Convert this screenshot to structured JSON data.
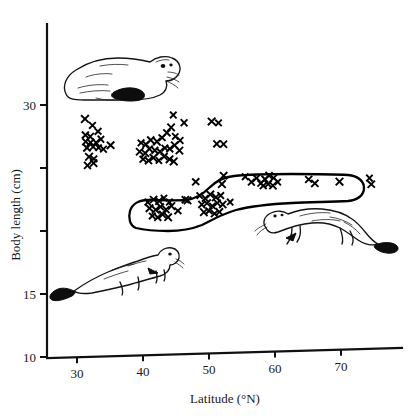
{
  "figure": {
    "title": "",
    "background_color": "#ffffff",
    "ink_color": "#111111"
  },
  "axes": {
    "y_title": "Body length (cm)",
    "x_title": "Latitude (°N)",
    "x_ticks": [
      {
        "value": 30,
        "label": "30"
      },
      {
        "value": 40,
        "label": "40"
      },
      {
        "value": 50,
        "label": "50"
      },
      {
        "value": 60,
        "label": "60"
      },
      {
        "value": 70,
        "label": "70"
      }
    ],
    "y_ticks": [
      {
        "value": 30,
        "label": "30"
      },
      {
        "value": 25,
        "label": ""
      },
      {
        "value": 20,
        "label": ""
      },
      {
        "value": 15,
        "label": "15"
      },
      {
        "value": 10,
        "label": "10"
      }
    ]
  },
  "chart_data": {
    "type": "scatter",
    "title": "",
    "xlabel": "Latitude (°N)",
    "ylabel": "Body length (cm)",
    "xlim": [
      27,
      77
    ],
    "ylim": [
      10,
      34
    ],
    "grid": false,
    "legend": "none",
    "marker": "x",
    "annotations": [
      {
        "name": "enclosed-outline",
        "type": "hull",
        "describes": "hand-drawn outline enclosing the lower (stoat) point cluster"
      },
      {
        "name": "weasel-resting-illustration",
        "type": "drawing"
      },
      {
        "name": "weasel-running-illustration",
        "type": "drawing"
      },
      {
        "name": "stoat-illustration",
        "type": "drawing"
      }
    ],
    "series": [
      {
        "name": "upper cluster (larger-bodied mustelid)",
        "enclosed": false,
        "points": [
          [
            31.2,
            28.9
          ],
          [
            32.3,
            28.4
          ],
          [
            31.3,
            27.6
          ],
          [
            32.0,
            27.5
          ],
          [
            33.2,
            27.9
          ],
          [
            31.3,
            27.1
          ],
          [
            32.1,
            27.0
          ],
          [
            32.9,
            27.0
          ],
          [
            33.6,
            27.3
          ],
          [
            31.5,
            26.6
          ],
          [
            32.4,
            26.7
          ],
          [
            33.3,
            26.6
          ],
          [
            34.0,
            26.5
          ],
          [
            35.1,
            26.8
          ],
          [
            31.8,
            25.9
          ],
          [
            32.6,
            25.7
          ],
          [
            31.6,
            25.2
          ],
          [
            32.5,
            25.4
          ],
          [
            39.7,
            27.0
          ],
          [
            40.4,
            26.9
          ],
          [
            41.2,
            27.2
          ],
          [
            42.1,
            27.1
          ],
          [
            42.9,
            27.4
          ],
          [
            43.6,
            27.8
          ],
          [
            44.3,
            28.2
          ],
          [
            44.9,
            27.5
          ],
          [
            45.6,
            27.2
          ],
          [
            39.5,
            26.3
          ],
          [
            40.3,
            26.2
          ],
          [
            41.0,
            26.5
          ],
          [
            41.8,
            26.4
          ],
          [
            42.6,
            26.3
          ],
          [
            43.3,
            26.6
          ],
          [
            44.1,
            26.5
          ],
          [
            44.8,
            26.8
          ],
          [
            45.5,
            26.4
          ],
          [
            40.0,
            25.7
          ],
          [
            40.8,
            25.6
          ],
          [
            41.6,
            25.8
          ],
          [
            42.4,
            25.6
          ],
          [
            43.2,
            25.9
          ],
          [
            44.0,
            25.7
          ],
          [
            44.7,
            25.5
          ],
          [
            44.6,
            29.2
          ],
          [
            46.2,
            28.6
          ],
          [
            50.4,
            28.7
          ],
          [
            51.4,
            28.6
          ],
          [
            51.2,
            26.9
          ],
          [
            52.2,
            26.9
          ]
        ]
      },
      {
        "name": "lower cluster (smaller-bodied mustelid, enclosed)",
        "enclosed": true,
        "points": [
          [
            40.7,
            22.3
          ],
          [
            41.6,
            22.5
          ],
          [
            42.4,
            22.4
          ],
          [
            43.2,
            22.6
          ],
          [
            44.0,
            22.3
          ],
          [
            41.0,
            21.8
          ],
          [
            41.9,
            21.7
          ],
          [
            42.7,
            21.9
          ],
          [
            43.5,
            21.7
          ],
          [
            44.3,
            22.0
          ],
          [
            41.4,
            21.2
          ],
          [
            42.2,
            21.1
          ],
          [
            43.0,
            21.3
          ],
          [
            43.8,
            21.1
          ],
          [
            45.3,
            21.6
          ],
          [
            46.4,
            22.5
          ],
          [
            46.8,
            22.4
          ],
          [
            48.6,
            22.8
          ],
          [
            49.4,
            22.6
          ],
          [
            50.2,
            22.9
          ],
          [
            51.0,
            22.7
          ],
          [
            51.8,
            22.8
          ],
          [
            48.9,
            22.1
          ],
          [
            49.7,
            22.2
          ],
          [
            50.5,
            22.0
          ],
          [
            51.3,
            22.2
          ],
          [
            52.1,
            22.1
          ],
          [
            49.2,
            21.5
          ],
          [
            50.0,
            21.6
          ],
          [
            50.8,
            21.4
          ],
          [
            51.6,
            21.5
          ],
          [
            53.2,
            22.3
          ],
          [
            48.0,
            23.9
          ],
          [
            52.2,
            24.4
          ],
          [
            52.0,
            23.7
          ],
          [
            55.5,
            24.3
          ],
          [
            56.4,
            23.9
          ],
          [
            57.2,
            24.2
          ],
          [
            57.8,
            23.8
          ],
          [
            58.5,
            24.1
          ],
          [
            59.1,
            24.4
          ],
          [
            59.8,
            24.2
          ],
          [
            58.2,
            23.6
          ],
          [
            59.0,
            23.7
          ],
          [
            59.7,
            23.6
          ],
          [
            60.4,
            23.9
          ],
          [
            65.1,
            24.1
          ],
          [
            66.0,
            23.8
          ],
          [
            69.8,
            23.9
          ],
          [
            74.3,
            24.2
          ],
          [
            74.6,
            23.7
          ]
        ]
      }
    ]
  },
  "illustrations": [
    {
      "name": "weasel-resting-illustration",
      "caption": ""
    },
    {
      "name": "weasel-running-illustration",
      "caption": ""
    },
    {
      "name": "stoat-illustration",
      "caption": ""
    }
  ]
}
